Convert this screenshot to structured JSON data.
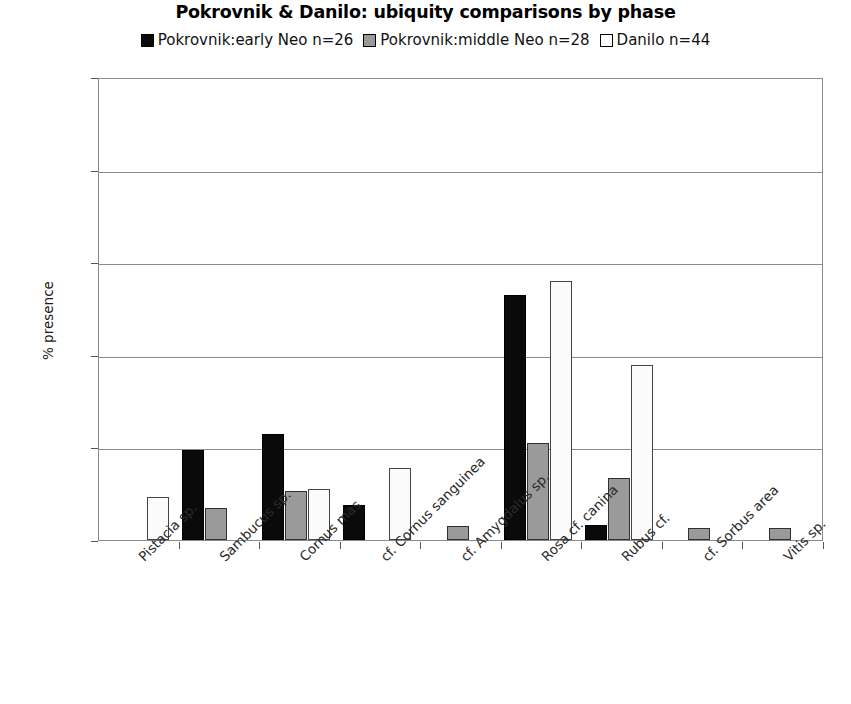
{
  "chart_data": {
    "type": "bar",
    "title": "Pokrovnik & Danilo: ubiquity comparisons by phase",
    "xlabel": "",
    "ylabel": "% presence",
    "ylim": [
      0,
      100
    ],
    "yticks": [
      0,
      20,
      40,
      60,
      80,
      100
    ],
    "grid": true,
    "legend_position": "top",
    "categories": [
      "Pistacia sp.",
      "Sambucus sp.",
      "Cornus mas",
      "cf. Cornus sanguinea",
      "cf. Amygdalus sp.",
      "Rosa cf. canina",
      "Rubus cf.",
      "cf. Sorbus area",
      "Vitis sp."
    ],
    "series": [
      {
        "name": "Pokrovnik:early Neo n=26",
        "color": "#0a0a0a",
        "values": [
          0,
          19.5,
          23,
          7.5,
          0,
          53,
          3.2,
          0,
          0
        ]
      },
      {
        "name": "Pokrovnik:middle Neo n=28",
        "color": "#9a9a9a",
        "values": [
          0,
          7,
          10.5,
          0,
          3,
          21,
          13.5,
          2.6,
          2.6
        ]
      },
      {
        "name": "Danilo n=44",
        "color": "#fbfbfb",
        "values": [
          9.3,
          0,
          11,
          15.6,
          0,
          56,
          37.7,
          0,
          0
        ]
      }
    ]
  }
}
